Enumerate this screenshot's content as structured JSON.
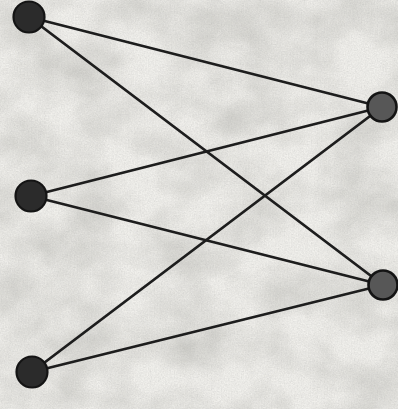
{
  "figure": {
    "type": "bipartite-graph",
    "canvas": {
      "width": 398,
      "height": 409
    },
    "colors": {
      "background": "#f2f1ed",
      "edge": "#1d1d1d",
      "left_node_fill": "#2b2b2b",
      "right_node_fill": "#575757",
      "node_stroke": "#141414"
    },
    "edge_width": 2.8,
    "nodes": [
      {
        "id": "L1",
        "side": "left",
        "x": 29,
        "y": 17,
        "r": 15.5,
        "fill": "#2b2b2b",
        "stroke_width": 2.2
      },
      {
        "id": "L2",
        "side": "left",
        "x": 31,
        "y": 196,
        "r": 15.5,
        "fill": "#2b2b2b",
        "stroke_width": 2.2
      },
      {
        "id": "L3",
        "side": "left",
        "x": 32,
        "y": 372,
        "r": 15.5,
        "fill": "#2b2b2b",
        "stroke_width": 2.2
      },
      {
        "id": "R1",
        "side": "right",
        "x": 382,
        "y": 107,
        "r": 14.5,
        "fill": "#575757",
        "stroke_width": 2.6
      },
      {
        "id": "R2",
        "side": "right",
        "x": 383,
        "y": 285,
        "r": 14.5,
        "fill": "#575757",
        "stroke_width": 2.6
      }
    ],
    "edges": [
      {
        "from": "L1",
        "to": "R1"
      },
      {
        "from": "L1",
        "to": "R2"
      },
      {
        "from": "L2",
        "to": "R1"
      },
      {
        "from": "L2",
        "to": "R2"
      },
      {
        "from": "L3",
        "to": "R1"
      },
      {
        "from": "L3",
        "to": "R2"
      }
    ]
  }
}
